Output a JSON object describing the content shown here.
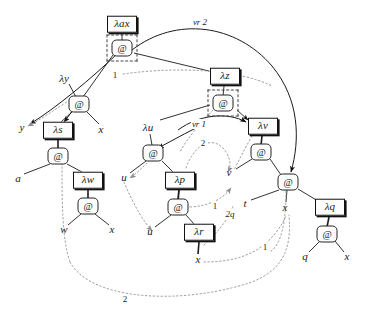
{
  "diagram": {
    "colors": {
      "stroke": "#111111",
      "background": "#ffffff",
      "dotted_edge": "#9a9a9a",
      "dashed_box": "#444444"
    },
    "nodes": [
      {
        "id": "lam_ax",
        "kind": "lambda",
        "label": "λax",
        "x": 122,
        "y": 24
      },
      {
        "id": "app_root",
        "kind": "app",
        "label": "@",
        "x": 122,
        "y": 48,
        "dashed_frame": true
      },
      {
        "id": "lam_y",
        "kind": "leaflabel",
        "label": "λy",
        "x": 64,
        "y": 78
      },
      {
        "id": "app_y",
        "kind": "app",
        "label": "@",
        "x": 79,
        "y": 104
      },
      {
        "id": "leaf_y",
        "kind": "leaf",
        "label": "y",
        "x": 22,
        "y": 127
      },
      {
        "id": "leaf_x1",
        "kind": "leaf",
        "label": "x",
        "x": 101,
        "y": 129
      },
      {
        "id": "lam_s",
        "kind": "lambda",
        "label": "λs",
        "x": 58,
        "y": 130
      },
      {
        "id": "app_s",
        "kind": "app",
        "label": "@",
        "x": 58,
        "y": 156
      },
      {
        "id": "leaf_a",
        "kind": "leaf",
        "label": "a",
        "x": 18,
        "y": 178
      },
      {
        "id": "lam_w",
        "kind": "lambda",
        "label": "λw",
        "x": 88,
        "y": 180
      },
      {
        "id": "app_w",
        "kind": "app",
        "label": "@",
        "x": 88,
        "y": 206
      },
      {
        "id": "leaf_w",
        "kind": "leaf",
        "label": "w",
        "x": 64,
        "y": 229
      },
      {
        "id": "leaf_x2",
        "kind": "leaf",
        "label": "x",
        "x": 112,
        "y": 229
      },
      {
        "id": "lam_z",
        "kind": "lambda",
        "label": "λz",
        "x": 225,
        "y": 76
      },
      {
        "id": "app_z",
        "kind": "app",
        "label": "@",
        "x": 223,
        "y": 103,
        "dashed_frame": true
      },
      {
        "id": "lam_u",
        "kind": "leaflabel",
        "label": "λu",
        "x": 148,
        "y": 127
      },
      {
        "id": "app_u",
        "kind": "app",
        "label": "@",
        "x": 153,
        "y": 153
      },
      {
        "id": "leaf_u1",
        "kind": "leaf",
        "label": "u",
        "x": 124,
        "y": 177
      },
      {
        "id": "lam_p",
        "kind": "lambda",
        "label": "λp",
        "x": 180,
        "y": 180
      },
      {
        "id": "app_p",
        "kind": "app",
        "label": "@",
        "x": 178,
        "y": 207
      },
      {
        "id": "leaf_u2",
        "kind": "leaf",
        "label": "u",
        "x": 150,
        "y": 231
      },
      {
        "id": "lam_r",
        "kind": "lambda",
        "label": "λr",
        "x": 199,
        "y": 232
      },
      {
        "id": "leaf_x3",
        "kind": "leaf",
        "label": "x",
        "x": 198,
        "y": 259
      },
      {
        "id": "lam_v",
        "kind": "lambda",
        "label": "λv",
        "x": 263,
        "y": 126
      },
      {
        "id": "app_v",
        "kind": "app",
        "label": "@",
        "x": 261,
        "y": 152
      },
      {
        "id": "leaf_v",
        "kind": "leaf",
        "label": "v",
        "x": 229,
        "y": 172
      },
      {
        "id": "app_mid",
        "kind": "app",
        "label": "@",
        "x": 288,
        "y": 182
      },
      {
        "id": "leaf_t",
        "kind": "leaf",
        "label": "t",
        "x": 245,
        "y": 203
      },
      {
        "id": "leaf_x4",
        "kind": "leaf",
        "label": "x",
        "x": 285,
        "y": 207
      },
      {
        "id": "lam_q",
        "kind": "lambda",
        "label": "λq",
        "x": 330,
        "y": 207
      },
      {
        "id": "app_q",
        "kind": "app",
        "label": "@",
        "x": 327,
        "y": 234
      },
      {
        "id": "leaf_q",
        "kind": "leaf",
        "label": "q",
        "x": 305,
        "y": 256
      },
      {
        "id": "leaf_x5",
        "kind": "leaf",
        "label": "x",
        "x": 347,
        "y": 256
      }
    ],
    "edge_labels": [
      {
        "id": "tag_vr2",
        "text": "vr 2",
        "x": 200,
        "y": 22
      },
      {
        "id": "tag_vr1",
        "text": "vr 1",
        "x": 199,
        "y": 124
      },
      {
        "id": "tag_one_top",
        "text": "1",
        "x": 115,
        "y": 75
      },
      {
        "id": "tag_two_mid",
        "text": "2",
        "x": 203,
        "y": 143
      },
      {
        "id": "tag_one_mid",
        "text": "1",
        "x": 215,
        "y": 206
      },
      {
        "id": "tag_two_q",
        "text": "2q",
        "x": 230,
        "y": 214
      },
      {
        "id": "tag_one_right",
        "text": "1",
        "x": 265,
        "y": 247
      },
      {
        "id": "tag_two_bottom",
        "text": "2",
        "x": 125,
        "y": 299
      }
    ]
  }
}
